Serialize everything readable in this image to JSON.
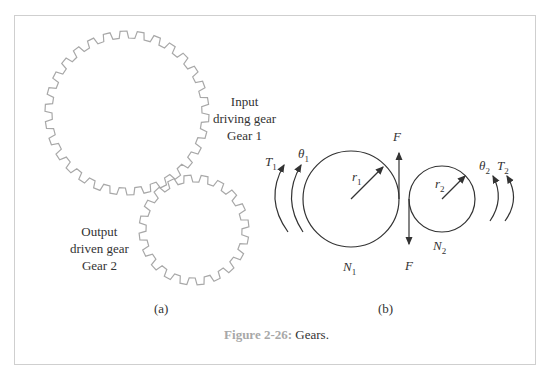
{
  "figure": {
    "caption_number": "Figure 2-26:",
    "caption_text": "Gears."
  },
  "panel_a": {
    "label": "(a)",
    "gear1": {
      "line1": "Input",
      "line2": "driving gear",
      "line3": "Gear  1",
      "teeth": 30
    },
    "gear2": {
      "line1": "Output",
      "line2": "driven gear",
      "line3": "Gear  2",
      "teeth": 20
    }
  },
  "panel_b": {
    "label": "(b)",
    "torque1": "T",
    "torque1_sub": "1",
    "theta1": "θ",
    "theta1_sub": "1",
    "radius1": "r",
    "radius1_sub": "1",
    "teeth1": "N",
    "teeth1_sub": "1",
    "force_top": "F",
    "force_bottom": "F",
    "radius2": "r",
    "radius2_sub": "2",
    "teeth2": "N",
    "teeth2_sub": "2",
    "theta2": "θ",
    "theta2_sub": "2",
    "torque2": "T",
    "torque2_sub": "2"
  },
  "colors": {
    "gear_stroke": "#a8a8a8",
    "line_stroke": "#333333",
    "frame": "#cfcfcf",
    "caption_number": "#a8a8a8"
  }
}
